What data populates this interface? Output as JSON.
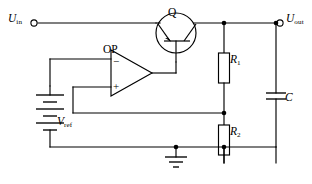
{
  "diagram": {
    "type": "schematic",
    "background_color": "#ffffff",
    "line_color": "#000000",
    "width": 312,
    "height": 184
  },
  "labels": {
    "input_terminal": {
      "symbol": "U",
      "subscript": "in",
      "name": "input-voltage-label"
    },
    "output_terminal": {
      "symbol": "U",
      "subscript": "out",
      "name": "output-voltage-label"
    },
    "transistor": {
      "symbol": "Q",
      "subscript": "",
      "name": "transistor-label"
    },
    "opamp": {
      "symbol": "OP",
      "subscript": "",
      "name": "opamp-label"
    },
    "resistor_top": {
      "symbol": "R",
      "subscript": "1",
      "name": "resistor-r1-label"
    },
    "resistor_bottom": {
      "symbol": "R",
      "subscript": "2",
      "name": "resistor-r2-label"
    },
    "capacitor": {
      "symbol": "C",
      "subscript": "",
      "name": "capacitor-label"
    },
    "reference_source": {
      "symbol": "V",
      "subscript": "ref",
      "name": "reference-voltage-label"
    }
  },
  "opamp": {
    "inverting_sign": "−",
    "noninverting_sign": "+",
    "inverting_input": "reference voltage",
    "noninverting_input": "feedback divider"
  },
  "components": [
    {
      "id": "Q",
      "kind": "bipolar-transistor",
      "label": "Q"
    },
    {
      "id": "OP",
      "kind": "operational-amplifier",
      "label": "OP"
    },
    {
      "id": "R1",
      "kind": "resistor",
      "label": "R1"
    },
    {
      "id": "R2",
      "kind": "resistor",
      "label": "R2"
    },
    {
      "id": "C",
      "kind": "capacitor",
      "label": "C"
    },
    {
      "id": "VREF",
      "kind": "battery",
      "label": "Vref"
    },
    {
      "id": "GND",
      "kind": "ground",
      "label": ""
    },
    {
      "id": "UIN",
      "kind": "terminal",
      "label": "Uin"
    },
    {
      "id": "UOUT",
      "kind": "terminal",
      "label": "Uout"
    }
  ],
  "nets": [
    {
      "from": "UIN",
      "to": "Q.emitter"
    },
    {
      "from": "Q.collector",
      "to": "UOUT"
    },
    {
      "from": "Q.base",
      "to": "OP.output"
    },
    {
      "from": "UOUT",
      "to": "R1.top"
    },
    {
      "from": "R1.bottom",
      "to": "R2.top"
    },
    {
      "from": "R2.top",
      "to": "OP.noninverting"
    },
    {
      "from": "R2.bottom",
      "to": "GND"
    },
    {
      "from": "UOUT",
      "to": "C.top"
    },
    {
      "from": "C.bottom",
      "to": "GND"
    },
    {
      "from": "VREF.positive",
      "to": "OP.inverting"
    },
    {
      "from": "VREF.negative",
      "to": "GND"
    }
  ]
}
